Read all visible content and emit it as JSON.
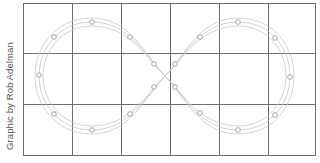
{
  "credit": "Graphic by Rob Adelman",
  "grid": {
    "columns": 6,
    "rows": 3,
    "line_color": "#6e6e6e"
  },
  "track": {
    "shape": "figure-eight",
    "lanes": 3,
    "line_color": "#c8c8c8"
  },
  "markers": {
    "count": 18,
    "color": "#9a9a9a"
  }
}
